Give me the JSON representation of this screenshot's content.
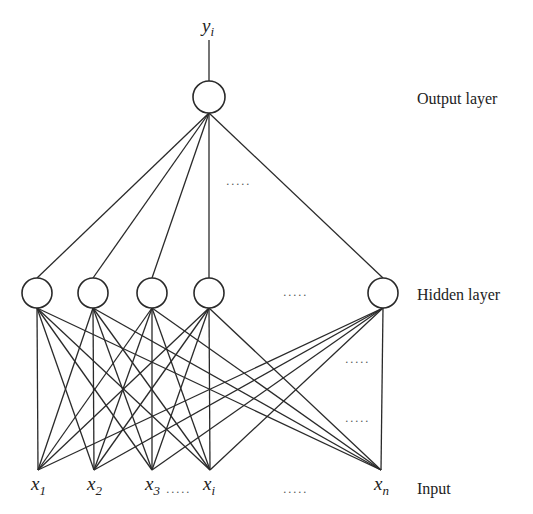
{
  "labels": {
    "output_layer": "Output layer",
    "hidden_layer": "Hidden layer",
    "input": "Input",
    "output_var": "y",
    "output_sub": "i"
  },
  "colors": {
    "line": "#2a2a2a",
    "text": "#222222",
    "background": "#ffffff"
  },
  "output_node": {
    "cx": 209,
    "cy": 97,
    "r": 16,
    "stem_top": 40
  },
  "hidden_nodes": [
    {
      "id": "h1",
      "cx": 37,
      "cy": 293,
      "r": 15
    },
    {
      "id": "h2",
      "cx": 93,
      "cy": 293,
      "r": 15
    },
    {
      "id": "h3",
      "cx": 152,
      "cy": 293,
      "r": 15
    },
    {
      "id": "h4",
      "cx": 209,
      "cy": 293,
      "r": 15
    },
    {
      "id": "h5",
      "cx": 383,
      "cy": 293,
      "r": 15
    }
  ],
  "inputs": [
    {
      "id": "x1",
      "x": 38,
      "y": 470,
      "var": "x",
      "sub": "1",
      "sub_italic": false
    },
    {
      "id": "x2",
      "x": 94,
      "y": 470,
      "var": "x",
      "sub": "2",
      "sub_italic": false
    },
    {
      "id": "x3",
      "x": 152,
      "y": 470,
      "var": "x",
      "sub": "3",
      "sub_italic": false
    },
    {
      "id": "xi",
      "x": 210,
      "y": 470,
      "var": "x",
      "sub": "i",
      "sub_italic": true
    },
    {
      "id": "xn",
      "x": 381,
      "y": 470,
      "var": "x",
      "sub": "n",
      "sub_italic": true
    }
  ],
  "ellipses": [
    {
      "id": "dots-output-hidden",
      "x": 226,
      "y": 185,
      "text": "....."
    },
    {
      "id": "dots-hidden-row",
      "x": 283,
      "y": 296,
      "text": "....."
    },
    {
      "id": "dots-right-upper",
      "x": 345,
      "y": 363,
      "text": "....."
    },
    {
      "id": "dots-right-lower",
      "x": 345,
      "y": 422,
      "text": "....."
    },
    {
      "id": "dots-input-x3-xi",
      "x": 166,
      "y": 493,
      "text": "....."
    },
    {
      "id": "dots-input-row",
      "x": 283,
      "y": 493,
      "text": "....."
    }
  ],
  "label_positions": {
    "output_layer": {
      "x": 417,
      "y": 104
    },
    "hidden_layer": {
      "x": 417,
      "y": 300
    },
    "input": {
      "x": 417,
      "y": 494
    },
    "output_var": {
      "x": 202,
      "y": 32
    }
  }
}
